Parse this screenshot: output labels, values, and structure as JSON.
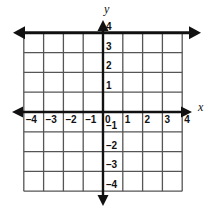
{
  "figure": {
    "kind": "cartesian-coordinate-grid",
    "axis_label_x": "x",
    "axis_label_y": "y",
    "background_color": "#ffffff",
    "grid_color": "#555555",
    "axis_color": "#111111",
    "graph_line_color": "#111111"
  },
  "chart_data": {
    "type": "line",
    "title": "",
    "xlabel": "x",
    "ylabel": "y",
    "xlim": [
      -4,
      4
    ],
    "ylim": [
      -4,
      4
    ],
    "grid": true,
    "legend": "none",
    "xticks": [
      -4,
      -3,
      -2,
      -1,
      0,
      1,
      2,
      3,
      4
    ],
    "yticks": [
      -4,
      -3,
      -2,
      -1,
      0,
      1,
      2,
      3,
      4
    ],
    "xticklabels": [
      "–4",
      "–3",
      "–2",
      "–1",
      "0",
      "1",
      "2",
      "3",
      "4"
    ],
    "yticklabels": [
      "–4",
      "–3",
      "–2",
      "–1",
      "0",
      "1",
      "2",
      "3",
      "4"
    ],
    "origin_label": "0",
    "series": [
      {
        "name": "y = 4",
        "equation": "y = 4",
        "orientation": "horizontal",
        "x": [
          -4,
          4
        ],
        "values": [
          4,
          4
        ],
        "arrows": "both",
        "linewidth": 3
      }
    ]
  },
  "geometry": {
    "origin_px": {
      "x": 103,
      "y": 112
    },
    "unit_px": 19.8,
    "grid_min": -4,
    "grid_max": 4
  },
  "xlabels": [
    {
      "text": "–4",
      "value": -4
    },
    {
      "text": "–3",
      "value": -3
    },
    {
      "text": "–2",
      "value": -2
    },
    {
      "text": "–1",
      "value": -1
    },
    {
      "text": "0",
      "value": 0
    },
    {
      "text": "1",
      "value": 1
    },
    {
      "text": "2",
      "value": 2
    },
    {
      "text": "3",
      "value": 3
    },
    {
      "text": "4",
      "value": 4
    }
  ],
  "ylabels": [
    {
      "text": "4",
      "value": 4
    },
    {
      "text": "3",
      "value": 3
    },
    {
      "text": "2",
      "value": 2
    },
    {
      "text": "1",
      "value": 1
    },
    {
      "text": "–1",
      "value": -1
    },
    {
      "text": "–2",
      "value": -2
    },
    {
      "text": "–3",
      "value": -3
    },
    {
      "text": "–4",
      "value": -4
    }
  ]
}
